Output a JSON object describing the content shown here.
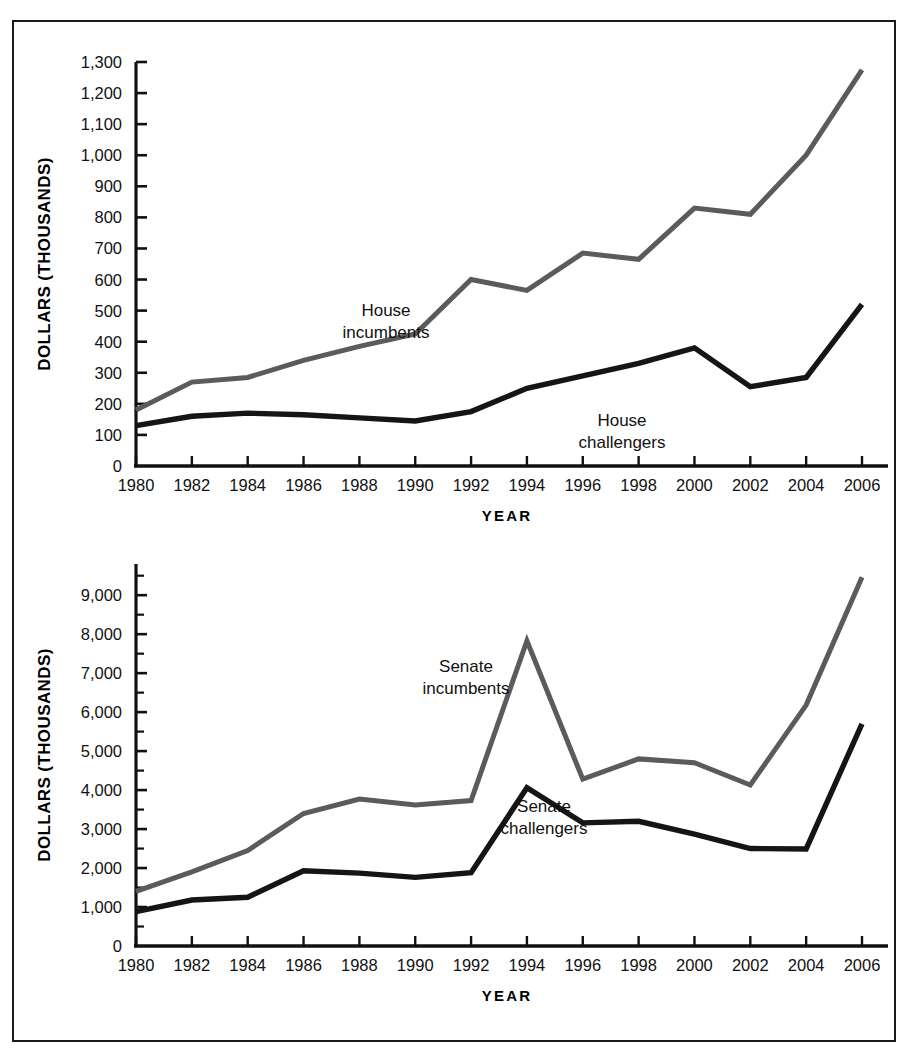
{
  "figure": {
    "scan_artifact_text": "",
    "panels": [
      "house",
      "senate"
    ]
  },
  "chart_data": [
    {
      "id": "house",
      "type": "line",
      "title": "",
      "xlabel": "YEAR",
      "ylabel": "DOLLARS (THOUSANDS)",
      "x": [
        1980,
        1982,
        1984,
        1986,
        1988,
        1990,
        1992,
        1994,
        1996,
        1998,
        2000,
        2002,
        2004,
        2006
      ],
      "categories": [
        "1980",
        "1982",
        "1984",
        "1986",
        "1988",
        "1990",
        "1992",
        "1994",
        "1996",
        "1998",
        "2000",
        "2002",
        "2004",
        "2006"
      ],
      "xlim": [
        1980,
        2006
      ],
      "ylim": [
        0,
        1300
      ],
      "ytick_labels": [
        "0",
        "100",
        "200",
        "300",
        "400",
        "500",
        "600",
        "700",
        "800",
        "900",
        "1,000",
        "1,100",
        "1,200",
        "1,300"
      ],
      "ytick_values": [
        0,
        100,
        200,
        300,
        400,
        500,
        600,
        700,
        800,
        900,
        1000,
        1100,
        1200,
        1300
      ],
      "ytick_step": 100,
      "grid": false,
      "legend_position": "inline-annotation",
      "series": [
        {
          "name": "House incumbents",
          "color": "#5b5b5b",
          "label_text_line1": "House",
          "label_text_line2": "incumbents",
          "values": [
            180,
            270,
            285,
            340,
            385,
            425,
            600,
            565,
            685,
            665,
            830,
            810,
            1000,
            1275
          ]
        },
        {
          "name": "House challengers",
          "color": "#151515",
          "label_text_line1": "House",
          "label_text_line2": "challengers",
          "values": [
            130,
            160,
            170,
            165,
            155,
            145,
            175,
            250,
            290,
            330,
            380,
            255,
            285,
            520
          ]
        }
      ]
    },
    {
      "id": "senate",
      "type": "line",
      "title": "",
      "xlabel": "YEAR",
      "ylabel": "DOLLARS (THOUSANDS)",
      "x": [
        1980,
        1982,
        1984,
        1986,
        1988,
        1990,
        1992,
        1994,
        1996,
        1998,
        2000,
        2002,
        2004,
        2006
      ],
      "categories": [
        "1980",
        "1982",
        "1984",
        "1986",
        "1988",
        "1990",
        "1992",
        "1994",
        "1996",
        "1998",
        "2000",
        "2002",
        "2004",
        "2006"
      ],
      "xlim": [
        1980,
        2006
      ],
      "ylim": [
        0,
        9800
      ],
      "ytick_labels": [
        "0",
        "1,000",
        "2,000",
        "3,000",
        "4,000",
        "5,000",
        "6,000",
        "7,000",
        "8,000",
        "9,000"
      ],
      "ytick_values": [
        0,
        1000,
        2000,
        3000,
        4000,
        5000,
        6000,
        7000,
        8000,
        9000
      ],
      "ytick_step": 1000,
      "minor_tick_step": 500,
      "grid": false,
      "legend_position": "inline-annotation",
      "series": [
        {
          "name": "Senate incumbents",
          "color": "#5b5b5b",
          "label_text_line1": "Senate",
          "label_text_line2": "incumbents",
          "values": [
            1400,
            1900,
            2450,
            3400,
            3770,
            3620,
            3730,
            7830,
            4280,
            4800,
            4700,
            4130,
            6180,
            9460
          ]
        },
        {
          "name": "Senate challengers",
          "color": "#151515",
          "label_text_line1": "Senate",
          "label_text_line2": "challengers",
          "values": [
            880,
            1180,
            1250,
            1930,
            1870,
            1760,
            1880,
            4060,
            3160,
            3200,
            2870,
            2500,
            2490,
            5700
          ]
        }
      ]
    }
  ]
}
